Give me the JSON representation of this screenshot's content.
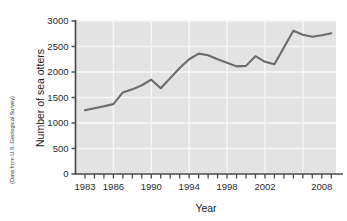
{
  "figure": {
    "source_note": "(Data from U.S. Geological Survey)",
    "background_color": "#ffffff",
    "plot_background_color": "#e3e3e3",
    "grid_color": "#f7f7f7",
    "axis_color": "#4a4a4a",
    "line_color": "#6b6b6b"
  },
  "chart_data": {
    "type": "line",
    "title": "",
    "xlabel": "Year",
    "ylabel": "Number of sea otters",
    "xlim": [
      1982,
      2009.5
    ],
    "ylim": [
      0,
      3000
    ],
    "grid": true,
    "legend": "none",
    "x_tick_labels": [
      "1983",
      "1986",
      "1990",
      "1994",
      "1998",
      "2002",
      "2008"
    ],
    "x_tick_label_values": [
      1983,
      1986,
      1990,
      1994,
      1998,
      2002,
      2008
    ],
    "x_minor_ticks_every": 1,
    "y_tick_labels": [
      "0",
      "500",
      "1000",
      "1500",
      "2000",
      "2500",
      "3000"
    ],
    "y_tick_values": [
      0,
      500,
      1000,
      1500,
      2000,
      2500,
      3000
    ],
    "x": [
      1983,
      1984,
      1985,
      1986,
      1987,
      1988,
      1989,
      1990,
      1991,
      1992,
      1993,
      1994,
      1995,
      1996,
      1997,
      1998,
      1999,
      2000,
      2001,
      2002,
      2003,
      2004,
      2005,
      2006,
      2007,
      2008,
      2009
    ],
    "values": [
      1250,
      1290,
      1330,
      1370,
      1600,
      1660,
      1740,
      1850,
      1680,
      1880,
      2080,
      2250,
      2360,
      2330,
      2250,
      2180,
      2110,
      2120,
      2310,
      2200,
      2150,
      2480,
      2810,
      2730,
      2690,
      2720,
      2760
    ],
    "series": [
      {
        "name": "Number of sea otters",
        "values": [
          1250,
          1290,
          1330,
          1370,
          1600,
          1660,
          1740,
          1850,
          1680,
          1880,
          2080,
          2250,
          2360,
          2330,
          2250,
          2180,
          2110,
          2120,
          2310,
          2200,
          2150,
          2480,
          2810,
          2730,
          2690,
          2720,
          2760
        ]
      }
    ]
  }
}
